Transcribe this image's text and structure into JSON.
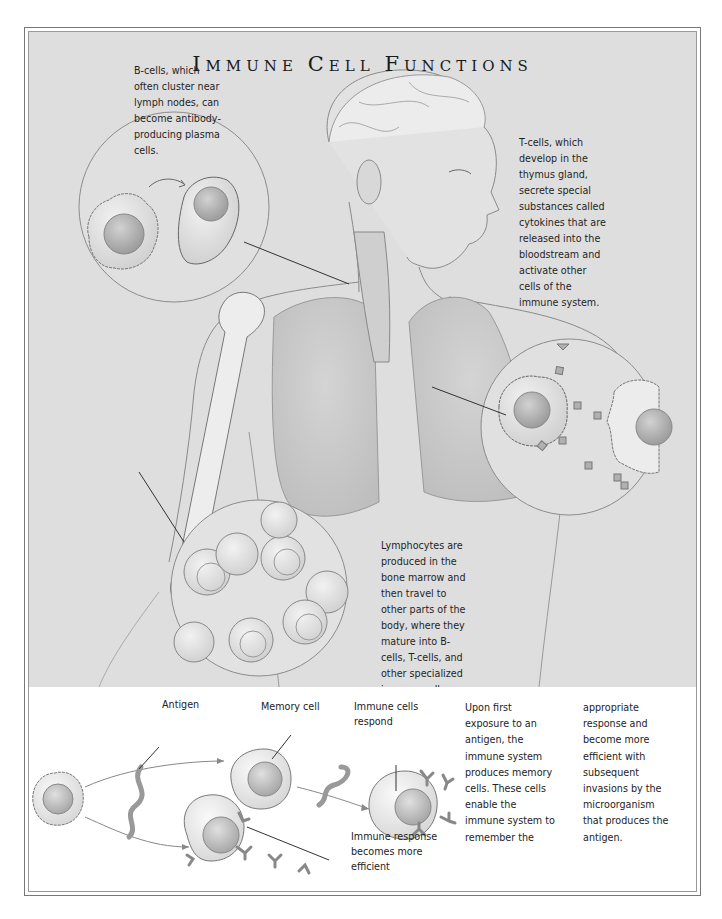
{
  "title": {
    "text": "Immune Cell Functions",
    "words": [
      {
        "initial": "I",
        "rest": "MMUNE"
      },
      {
        "initial": "C",
        "rest": "ELL"
      },
      {
        "initial": "F",
        "rest": "UNCTIONS"
      }
    ]
  },
  "captions": {
    "b_cells": "B-cells, which\noften cluster near\nlymph nodes, can\nbecome antibody-\nproducing plasma\ncells.",
    "t_cells": "T-cells, which\ndevelop in the\nthymus gland,\nsecrete special\nsubstances called\ncytokines that are\nreleased into the\nbloodstream and\nactivate other\ncells of the\nimmune system.",
    "lymphocytes": "Lymphocytes are\nproduced in the\nbone marrow and\nthen travel to\nother parts of the\nbody, where they\nmature into B-\ncells, T-cells, and\nother specialized\nimmune cells."
  },
  "diagram": {
    "labels": {
      "antigen": "Antigen",
      "memory_cell": "Memory cell",
      "immune_cells_respond": "Immune cells\nrespond",
      "immune_response": "Immune response\nbecomes more\nefficient"
    },
    "text_col1": "Upon first\nexposure to an\nantigen, the\nimmune system\nproduces memory\ncells. These cells\nenable the\nimmune system to\nremember the",
    "text_col2": "appropriate\nresponse and\nbecome more\nefficient with\nsubsequent\ninvasions by the\nmicroorganism\nthat produces the\nantigen."
  },
  "colors": {
    "panel_gray": "#dedede",
    "line": "#555555",
    "cell_fill": "#e9e9e9",
    "nucleus": "#b5b5b5"
  }
}
